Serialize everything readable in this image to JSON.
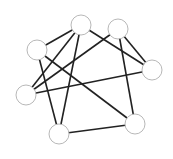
{
  "graph": {
    "colors": {
      "edge": "#222222",
      "node_fill": "#ffffff",
      "node_stroke": "#b8b8b8",
      "background": "#ffffff"
    },
    "node_radius": 10,
    "nodes": [
      {
        "id": "A",
        "x": 81,
        "y": 25
      },
      {
        "id": "B",
        "x": 118,
        "y": 29
      },
      {
        "id": "C",
        "x": 37,
        "y": 50
      },
      {
        "id": "D",
        "x": 152,
        "y": 70
      },
      {
        "id": "E",
        "x": 26,
        "y": 95
      },
      {
        "id": "F",
        "x": 59,
        "y": 134
      },
      {
        "id": "G",
        "x": 135,
        "y": 124
      }
    ],
    "edges": [
      [
        "A",
        "C"
      ],
      [
        "A",
        "E"
      ],
      [
        "A",
        "F"
      ],
      [
        "A",
        "D"
      ],
      [
        "B",
        "E"
      ],
      [
        "B",
        "D"
      ],
      [
        "B",
        "G"
      ],
      [
        "C",
        "F"
      ],
      [
        "C",
        "G"
      ],
      [
        "E",
        "D"
      ],
      [
        "F",
        "G"
      ]
    ]
  }
}
